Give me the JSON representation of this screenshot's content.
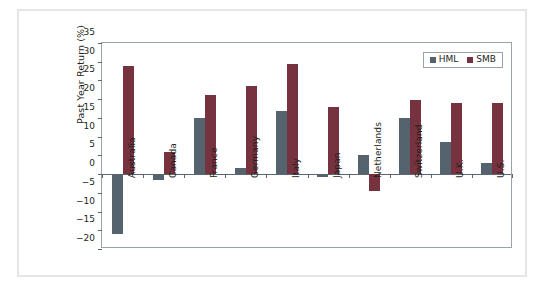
{
  "chart_data": {
    "type": "bar",
    "title": "",
    "xlabel": "",
    "ylabel": "Past Year Return (%)",
    "ylim": [
      -20,
      35
    ],
    "ytick_step": 5,
    "yticks": [
      35,
      30,
      25,
      20,
      15,
      10,
      5,
      0,
      -5,
      -10,
      -15,
      -20
    ],
    "ytick_labels": [
      "35",
      "30",
      "25",
      "20",
      "15",
      "10",
      "5",
      "0",
      "−5",
      "−10",
      "−15",
      "−20"
    ],
    "grid": false,
    "legend_position": "top-right",
    "categories": [
      "Australia",
      "Canada",
      "France",
      "Germany",
      "Italy",
      "Japan",
      "Netherlands",
      "Switzerland",
      "U.K.",
      "U.S."
    ],
    "series": [
      {
        "name": "HML",
        "color": "#55636f",
        "values": [
          -16.0,
          -1.5,
          15.0,
          1.5,
          16.8,
          -0.8,
          5.0,
          15.0,
          8.5,
          3.0
        ]
      },
      {
        "name": "SMB",
        "color": "#76333f",
        "values": [
          28.8,
          6.0,
          21.0,
          23.5,
          29.5,
          18.0,
          -4.5,
          19.8,
          19.0,
          19.0
        ]
      }
    ]
  },
  "legend": {
    "entries": [
      {
        "label": "HML",
        "color": "#55636f"
      },
      {
        "label": "SMB",
        "color": "#76333f"
      }
    ]
  },
  "colors": {
    "hml": "#55636f",
    "smb": "#76333f",
    "axis": "#5d666e",
    "frame": "#9aa3ab",
    "outer_border": "#e3e5e7",
    "text": "#231f20",
    "background": "#ffffff"
  }
}
